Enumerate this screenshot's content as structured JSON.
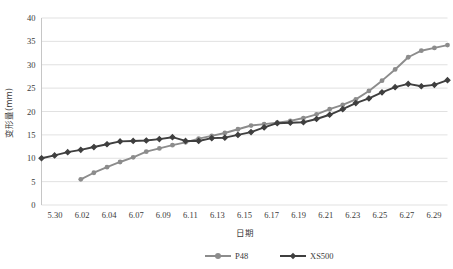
{
  "chart_data": {
    "type": "line",
    "title": "",
    "xlabel": "日期",
    "ylabel": "变形量(mm)",
    "ylim": [
      0,
      40
    ],
    "ytick_step": 5,
    "yticks": [
      "0",
      "5",
      "10",
      "15",
      "20",
      "25",
      "30",
      "35",
      "40"
    ],
    "grid": true,
    "legend_position": "bottom",
    "categories": [
      "5.30",
      "5.31",
      "6.01",
      "6.02",
      "6.03",
      "6.04",
      "6.05",
      "6.06",
      "6.07",
      "6.08",
      "6.09",
      "6.10",
      "6.11",
      "6.12",
      "6.13",
      "6.14",
      "6.15",
      "6.16",
      "6.17",
      "6.18",
      "6.19",
      "6.20",
      "6.21",
      "6.22",
      "6.23",
      "6.24",
      "6.25",
      "6.26",
      "6.27",
      "6.28",
      "6.29",
      "6.30"
    ],
    "xtick_labels": [
      "5.30",
      "6.02",
      "6.04",
      "6.07",
      "6.09",
      "6.11",
      "6.13",
      "6.15",
      "6.17",
      "6.19",
      "6.21",
      "6.23",
      "6.25",
      "6.27",
      "6.29"
    ],
    "series": [
      {
        "name": "P48",
        "color": "#8c8c8c",
        "marker": "circle",
        "values": [
          null,
          null,
          null,
          5.5,
          6.9,
          8.1,
          9.2,
          10.2,
          11.4,
          12.1,
          12.8,
          13.4,
          14.2,
          14.8,
          15.4,
          16.2,
          17.0,
          17.3,
          17.6,
          18.0,
          18.6,
          19.4,
          20.5,
          21.4,
          22.6,
          24.4,
          26.6,
          29.0,
          31.6,
          33.0,
          33.6,
          34.2
        ]
      },
      {
        "name": "XS500",
        "color": "#3f3f3f",
        "marker": "diamond",
        "values": [
          10.0,
          10.6,
          11.3,
          11.8,
          12.4,
          13.0,
          13.6,
          13.7,
          13.8,
          14.1,
          14.5,
          13.7,
          13.7,
          14.3,
          14.4,
          15.0,
          15.6,
          16.6,
          17.5,
          17.6,
          17.7,
          18.4,
          19.3,
          20.5,
          21.8,
          22.8,
          24.1,
          25.2,
          25.9,
          25.4,
          25.7,
          26.7
        ]
      }
    ]
  },
  "legend": {
    "items": [
      {
        "label": "P48",
        "color": "#8c8c8c"
      },
      {
        "label": "XS500",
        "color": "#3f3f3f"
      }
    ]
  }
}
